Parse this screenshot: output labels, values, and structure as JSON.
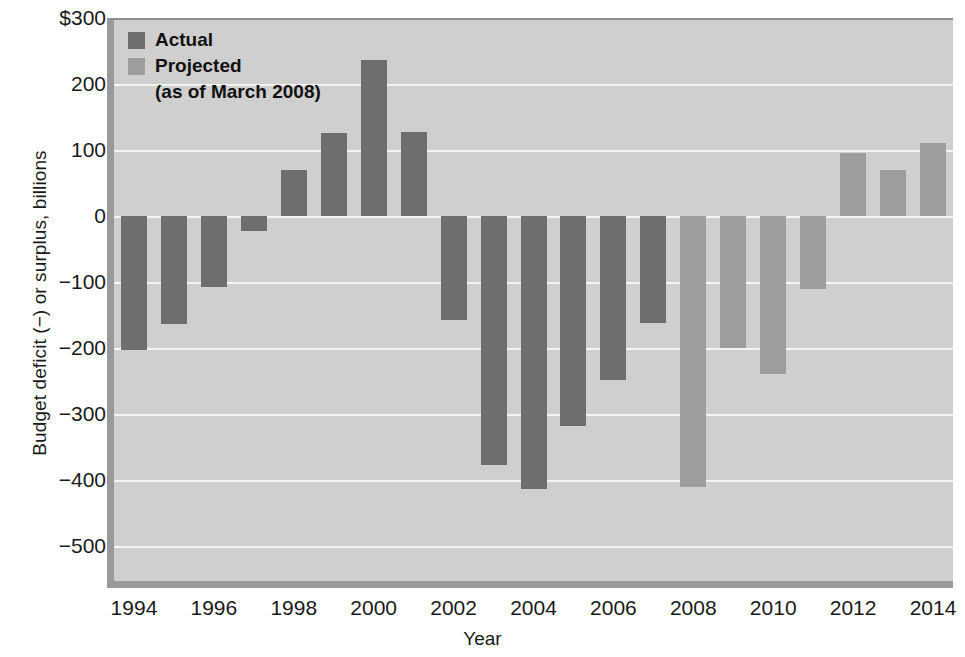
{
  "chart_data": {
    "type": "bar",
    "title": "",
    "xlabel": "Year",
    "ylabel": "Budget deficit (−) or surplus, billions",
    "ylim": [
      -560,
      300
    ],
    "ytick_labels": [
      "$300",
      "200",
      "100",
      "0",
      "−100",
      "−200",
      "−300",
      "−400",
      "−500"
    ],
    "ytick_values": [
      300,
      200,
      100,
      0,
      -100,
      -200,
      -300,
      -400,
      -500
    ],
    "xtick_labels": [
      "1994",
      "1996",
      "1998",
      "2000",
      "2002",
      "2004",
      "2006",
      "2008",
      "2010",
      "2012",
      "2014"
    ],
    "xtick_values": [
      1994,
      1996,
      1998,
      2000,
      2002,
      2004,
      2006,
      2008,
      2010,
      2012,
      2014
    ],
    "grid": "horizontal",
    "legend_position": "top-left",
    "series": [
      {
        "name": "Actual",
        "color": "#6e6e6e",
        "x": [
          1994,
          1995,
          1996,
          1997,
          1998,
          1999,
          2000,
          2001,
          2002,
          2003,
          2004,
          2005,
          2006,
          2007
        ],
        "values": [
          -203,
          -164,
          -107,
          -22,
          69,
          126,
          236,
          128,
          -158,
          -378,
          -413,
          -318,
          -248,
          -162
        ]
      },
      {
        "name": "Projected",
        "color": "#9d9d9d",
        "x": [
          2008,
          2009,
          2010,
          2011,
          2012,
          2013,
          2014
        ],
        "values": [
          -410,
          -200,
          -240,
          -110,
          95,
          70,
          110
        ]
      }
    ],
    "categories": [
      1994,
      1995,
      1996,
      1997,
      1998,
      1999,
      2000,
      2001,
      2002,
      2003,
      2004,
      2005,
      2006,
      2007,
      2008,
      2009,
      2010,
      2011,
      2012,
      2013,
      2014
    ],
    "values": [
      -203,
      -164,
      -107,
      -22,
      69,
      126,
      236,
      128,
      -158,
      -378,
      -413,
      -318,
      -248,
      -162,
      -410,
      -200,
      -240,
      -110,
      95,
      70,
      110
    ]
  },
  "legend": {
    "actual_label": "Actual",
    "projected_label": "Projected",
    "projected_note": "(as of March 2008)"
  },
  "axes": {
    "y_title": "Budget deficit (−) or surplus, billions",
    "x_title": "Year"
  }
}
